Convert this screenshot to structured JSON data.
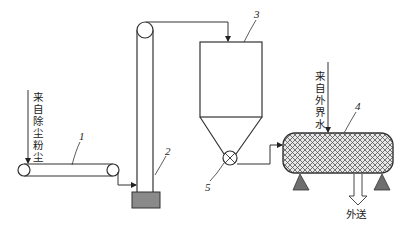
{
  "diagram": {
    "type": "process-flow",
    "components": [
      {
        "id": "1",
        "name": "belt-conveyor",
        "label": "1"
      },
      {
        "id": "2",
        "name": "bucket-elevator",
        "label": "2"
      },
      {
        "id": "3",
        "name": "silo",
        "label": "3"
      },
      {
        "id": "4",
        "name": "mixing-tank",
        "label": "4"
      },
      {
        "id": "5",
        "name": "rotary-valve",
        "label": "5"
      }
    ],
    "inputs": {
      "dust_source": {
        "chars": [
          "来",
          "自",
          "除",
          "尘",
          "粉",
          "尘"
        ],
        "text": "来自除尘粉尘"
      },
      "water_source": {
        "chars": [
          "来",
          "自",
          "外",
          "界",
          "水"
        ],
        "text": "来自外界水"
      }
    },
    "output": {
      "text": "外送"
    },
    "colors": {
      "line": "#333333",
      "base_fill": "#8a8a8a",
      "support_fill": "#6e6e6e",
      "hatch": "#555555"
    }
  }
}
